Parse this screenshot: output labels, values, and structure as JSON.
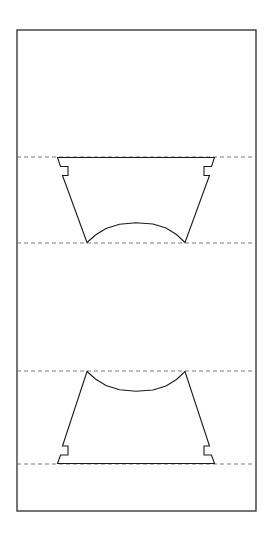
{
  "document": {
    "title": "Sheet Metal Development Drawing",
    "background_color": "#ffffff"
  },
  "canvas": {
    "width": 273,
    "height": 534
  },
  "styles": {
    "outline_color": "#3a3a3a",
    "outline_width": 1.4,
    "part_color": "#1a1a1a",
    "part_width": 1.1,
    "fold_line_color": "#6b6b6b",
    "fold_line_width": 0.9,
    "fold_dash_pattern": "4 3",
    "fill": "none"
  },
  "sheet_outline": {
    "name": "blank-sheet-rectangle",
    "x": 17,
    "y": 30,
    "width": 239,
    "height": 481
  },
  "fold_lines": [
    {
      "name": "fold-line-1",
      "y": 157,
      "x1": 17,
      "x2": 256
    },
    {
      "name": "fold-line-2",
      "y": 243,
      "x1": 17,
      "x2": 256
    },
    {
      "name": "fold-line-3",
      "y": 371,
      "x1": 17,
      "x2": 256
    },
    {
      "name": "fold-line-4",
      "y": 464,
      "x1": 17,
      "x2": 256
    }
  ],
  "parts": {
    "upper_part": {
      "name": "upper-trapezoid-part",
      "path": "M 57.5 157.5 L 214.5 157.5 L 211.5 166.5 L 204.0 166.5 L 204.0 175.5 L 209.5 175.5 L 185.0 242.5 L 176.5 234.5 L 166.0 228.0 L 153.0 224.0 L 136.0 222.8 L 119.5 224.2 L 106.0 228.5 L 95.5 235.0 L 87.0 242.5 L 62.5 175.5 L 68.0 175.5 L 68.0 166.5 L 60.5 166.5 Z",
      "top_edge": {
        "y": 157,
        "x_left": 57,
        "x_right": 215
      },
      "bottom_arc_ends": {
        "y": 243,
        "x_left": 87,
        "x_right": 185
      },
      "arc_apex_y": 223
    },
    "lower_part": {
      "name": "lower-trapezoid-part",
      "path": "M 87.0 371.5 L 95.5 379.0 L 106.0 385.5 L 119.5 389.8 L 136.0 391.2 L 153.0 390.0 L 166.0 386.0 L 176.5 379.5 L 185.0 371.5 L 209.5 446.0 L 204.0 446.0 L 204.0 455.0 L 211.5 455.0 L 214.5 463.5 L 57.5 463.5 L 60.5 455.0 L 68.0 455.0 L 68.0 446.0 L 62.5 446.0 Z",
      "bottom_edge": {
        "y": 464,
        "x_left": 57,
        "x_right": 215
      },
      "top_arc_ends": {
        "y": 371,
        "x_left": 87,
        "x_right": 185
      },
      "arc_apex_y": 391
    }
  },
  "features": [
    {
      "name": "notch-upper-left",
      "x": 60,
      "y": 166,
      "width": 8,
      "height": 9
    },
    {
      "name": "notch-upper-right",
      "x": 204,
      "y": 166,
      "width": 8,
      "height": 9
    },
    {
      "name": "notch-lower-left",
      "x": 60,
      "y": 446,
      "width": 8,
      "height": 9
    },
    {
      "name": "notch-lower-right",
      "x": 204,
      "y": 446,
      "width": 8,
      "height": 9
    }
  ]
}
